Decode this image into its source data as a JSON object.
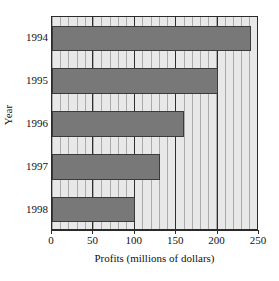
{
  "chart_data": {
    "type": "bar",
    "orientation": "horizontal",
    "title": "",
    "xlabel": "Profits (millions of dollars)",
    "ylabel": "Year",
    "categories": [
      "1994",
      "1995",
      "1996",
      "1997",
      "1998"
    ],
    "values": [
      240,
      200,
      160,
      130,
      100
    ],
    "series": [
      {
        "name": "Profits",
        "values": [
          240,
          200,
          160,
          130,
          100
        ]
      }
    ],
    "xlim": [
      0,
      250
    ],
    "xticks": [
      0,
      50,
      100,
      150,
      200,
      250
    ],
    "xtick_labels": [
      "0",
      "50",
      "100",
      "150",
      "200",
      "250"
    ],
    "ytick_labels": [
      "1994",
      "1995",
      "1996",
      "1997",
      "1998"
    ],
    "grid": true,
    "grid_axis": "x",
    "minor_grid_step": 10,
    "major_grid_step": 50,
    "legend": false,
    "legend_position": "none",
    "colors": {
      "bar_fill": "#787878",
      "bar_edge": "#3a3a3a",
      "plot_background": "#e8e8e8",
      "minor_gridline": "#787878",
      "major_gridline": "#2f2f2f",
      "axis": "#2b2b2b",
      "text": "#111111",
      "figure_background": "#ffffff"
    }
  },
  "axes": {
    "x_title": "Profits (millions of dollars)",
    "y_title": "Year"
  }
}
